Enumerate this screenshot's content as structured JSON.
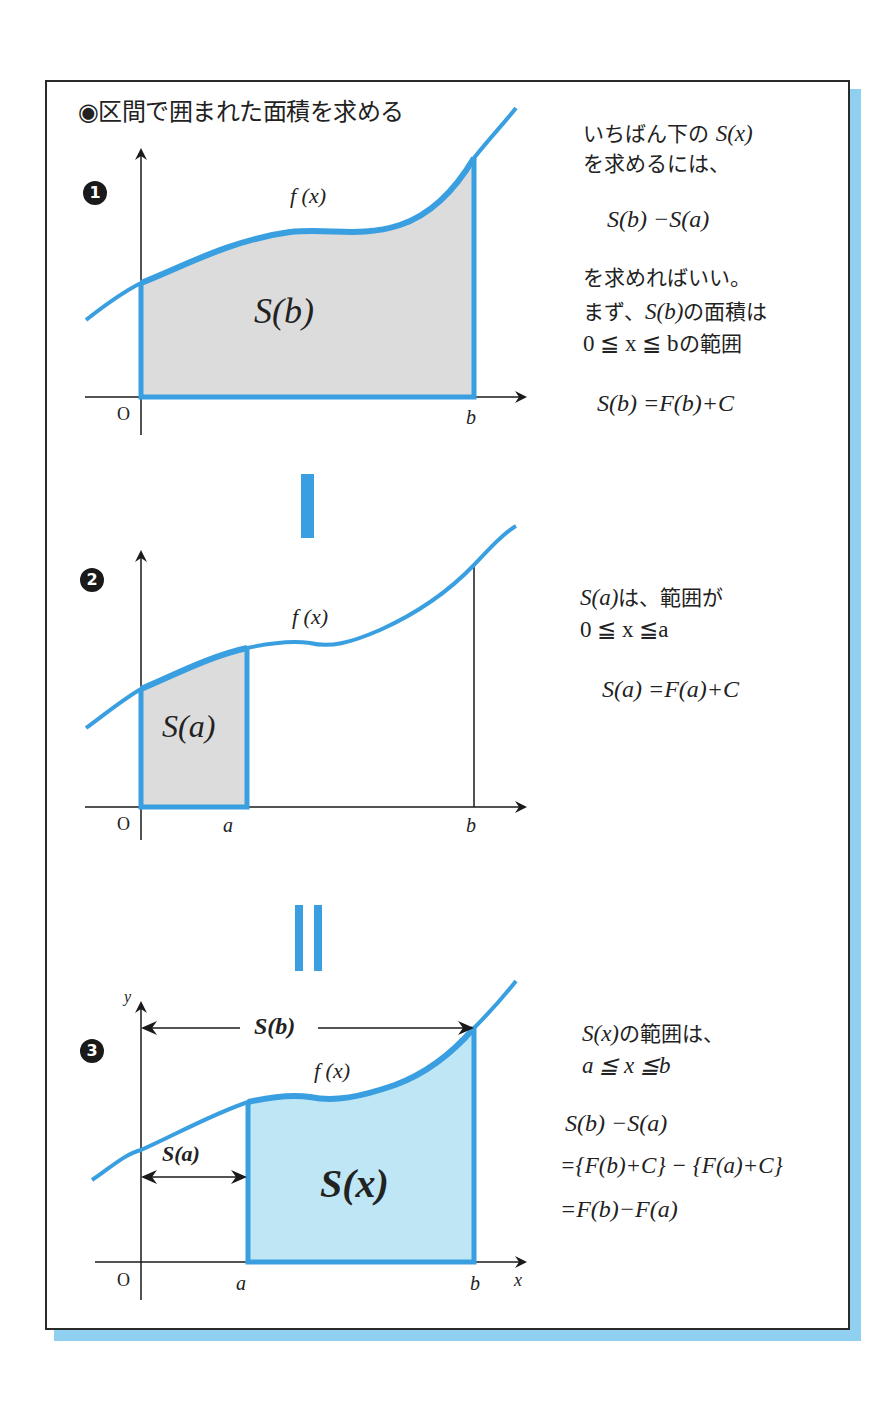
{
  "title": "◉区間で囲まれた面積を求める",
  "colors": {
    "curve": "#3a9fe0",
    "fill_gray": "#dcdcdc",
    "fill_blue": "#bfe6f4",
    "frame": "#2a2a2a",
    "shadow": "#8fd0f0",
    "badge": "#1a1a1a"
  },
  "panel1": {
    "badge": "1",
    "curve_label": "f (x)",
    "area_label": "S(b)",
    "origin_label": "O",
    "b_label": "b",
    "text": {
      "line1_jp": "いちばん下の",
      "line1_math": "S(x)",
      "line2": "を求めるには、",
      "formula1": "S(b) −S(a)",
      "line3": "を求めればいい。",
      "line4_jp_a": "まず、",
      "line4_math": "S(b)",
      "line4_jp_b": "の面積は",
      "line5_math": "0 ≦ x ≦ b",
      "line5_jp": "の範囲",
      "formula2": "S(b) =F(b)+C"
    }
  },
  "separator1": "minus",
  "panel2": {
    "badge": "2",
    "curve_label": "f (x)",
    "area_label": "S(a)",
    "origin_label": "O",
    "a_label": "a",
    "b_label": "b",
    "text": {
      "line1_math": "S(a)",
      "line1_jp": "は、範囲が",
      "line2_math": "0 ≦ x ≦a",
      "formula": "S(a) =F(a)+C"
    }
  },
  "separator2": "equals",
  "panel3": {
    "badge": "3",
    "curve_label": "f (x)",
    "area_label": "S(x)",
    "span_b_label": "S(b)",
    "span_a_label": "S(a)",
    "origin_label": "O",
    "a_label": "a",
    "b_label": "b",
    "x_axis_label": "x",
    "y_axis_label": "y",
    "text": {
      "line1_math": "S(x)",
      "line1_jp": "の範囲は、",
      "line2_math": "a ≦ x ≦b",
      "formula1": "S(b) −S(a)",
      "formula2": "={F(b)+C} − {F(a)+C}",
      "formula3": "=F(b)−F(a)"
    }
  }
}
